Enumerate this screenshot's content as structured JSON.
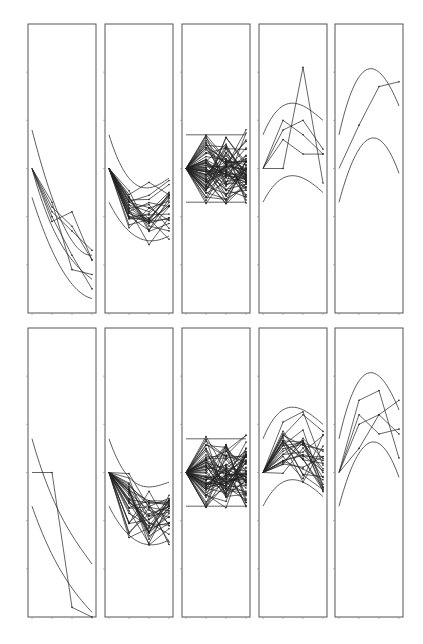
{
  "chart_data": {
    "type": "line",
    "title": "",
    "layout": {
      "rows": 2,
      "cols": 5,
      "grid": false,
      "legend": "none"
    },
    "x": [
      0,
      1,
      2,
      3
    ],
    "xlabel": "",
    "ylabel": "",
    "ylim": [
      -3,
      3
    ],
    "yticks": [
      -2,
      -1,
      0,
      1,
      2
    ],
    "xticks": [
      0,
      1,
      2,
      3
    ],
    "panels": [
      {
        "row": 0,
        "col": 0,
        "description": "decreasing trajectories with decreasing envelope curves",
        "envelope": {
          "upper": [
            0.8,
            -0.6,
            -1.5,
            -1.8
          ],
          "middle": [
            0.0,
            -1.2,
            -1.9,
            -2.3
          ],
          "lower": [
            -0.6,
            -1.7,
            -2.4,
            -2.7
          ]
        },
        "series": [
          [
            0,
            -0.9,
            -1.3,
            -1.7
          ],
          [
            0,
            -1.1,
            -0.9,
            -1.9
          ],
          [
            0,
            -0.7,
            -2.1,
            -2.2
          ],
          [
            0,
            -1.0,
            -1.8,
            -2.5
          ],
          [
            0,
            -0.8,
            -1.2,
            -1.9
          ]
        ]
      },
      {
        "row": 0,
        "col": 1,
        "description": "many decreasing trajectories",
        "envelope": {
          "upper": [
            0.7,
            -0.2,
            -0.4,
            -0.2
          ],
          "lower": [
            -0.7,
            -1.3,
            -1.5,
            -1.4
          ]
        },
        "series_count": 25
      },
      {
        "row": 0,
        "col": 2,
        "description": "dense noise band around zero with constant bounds",
        "envelope": {
          "upper": [
            0.7,
            0.7,
            0.7,
            0.7
          ],
          "lower": [
            -0.7,
            -0.7,
            -0.7,
            -0.7
          ]
        },
        "series_count": 60
      },
      {
        "row": 0,
        "col": 3,
        "description": "increasing then plateau trajectories with concave envelope",
        "envelope": {
          "upper": [
            0.7,
            1.3,
            1.3,
            1.0
          ],
          "lower": [
            -0.7,
            -0.2,
            -0.2,
            -0.5
          ]
        },
        "series": [
          [
            0,
            1.0,
            0.7,
            0.3
          ],
          [
            0,
            0.8,
            1.0,
            0.4
          ],
          [
            0,
            0.0,
            2.1,
            -0.3
          ],
          [
            0,
            0.6,
            0.3,
            0.3
          ]
        ]
      },
      {
        "row": 0,
        "col": 4,
        "description": "single increasing trajectory with concave envelope",
        "envelope": {
          "upper": [
            0.7,
            1.9,
            2.0,
            1.3
          ],
          "lower": [
            -0.7,
            0.4,
            0.6,
            -0.1
          ]
        },
        "series": [
          [
            0,
            0.9,
            1.7,
            1.8
          ]
        ]
      },
      {
        "row": 1,
        "col": 0,
        "description": "two decreasing trajectories",
        "envelope": {
          "upper": [
            0.7,
            -0.5,
            -1.3,
            -1.9
          ],
          "lower": [
            -0.7,
            -1.7,
            -2.4,
            -2.9
          ]
        },
        "series": [
          [
            0,
            0.0,
            -2.8,
            -3.2
          ]
        ]
      },
      {
        "row": 1,
        "col": 1,
        "description": "many noisy decreasing trajectories",
        "envelope": {
          "upper": [
            0.7,
            -0.1,
            -0.3,
            -0.2
          ],
          "lower": [
            -0.7,
            -1.3,
            -1.5,
            -1.4
          ]
        },
        "series_count": 30
      },
      {
        "row": 1,
        "col": 2,
        "description": "dense noise band around zero with constant bounds",
        "envelope": {
          "upper": [
            0.7,
            0.7,
            0.7,
            0.7
          ],
          "lower": [
            -0.7,
            -0.7,
            -0.7,
            -0.7
          ]
        },
        "series_count": 60
      },
      {
        "row": 1,
        "col": 3,
        "description": "increasing then plateau trajectories",
        "envelope": {
          "upper": [
            0.7,
            1.3,
            1.3,
            1.0
          ],
          "lower": [
            -0.7,
            -0.2,
            -0.2,
            -0.5
          ]
        },
        "series_count": 25
      },
      {
        "row": 1,
        "col": 4,
        "description": "several increasing then decreasing trajectories",
        "envelope": {
          "upper": [
            0.7,
            1.9,
            2.0,
            1.3
          ],
          "lower": [
            -0.7,
            0.4,
            0.6,
            -0.1
          ]
        },
        "series": [
          [
            0,
            1.5,
            1.7,
            0.3
          ],
          [
            0,
            1.0,
            1.2,
            0.8
          ],
          [
            0,
            0.5,
            1.2,
            1.5
          ],
          [
            0,
            1.2,
            0.8,
            0.9
          ]
        ]
      }
    ]
  }
}
